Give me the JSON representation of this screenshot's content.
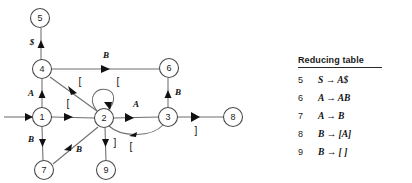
{
  "diagram": {
    "type": "state-transition-graph",
    "nodes": [
      {
        "id": "5",
        "label": "5",
        "cx": 40,
        "cy": 18
      },
      {
        "id": "4",
        "label": "4",
        "cx": 42,
        "cy": 69
      },
      {
        "id": "6",
        "label": "6",
        "cx": 169,
        "cy": 68
      },
      {
        "id": "1",
        "label": "1",
        "cx": 42,
        "cy": 117
      },
      {
        "id": "2",
        "label": "2",
        "cx": 104,
        "cy": 118
      },
      {
        "id": "3",
        "label": "3",
        "cx": 168,
        "cy": 117
      },
      {
        "id": "8",
        "label": "8",
        "cx": 233,
        "cy": 117
      },
      {
        "id": "7",
        "label": "7",
        "cx": 44,
        "cy": 170
      },
      {
        "id": "9",
        "label": "9",
        "cx": 106,
        "cy": 170
      }
    ],
    "edges": [
      {
        "from": "start",
        "to": "1",
        "label": ""
      },
      {
        "from": "4",
        "to": "5",
        "label": "$"
      },
      {
        "from": "1",
        "to": "4",
        "label": "A"
      },
      {
        "from": "4",
        "to": "6",
        "label": "B"
      },
      {
        "from": "4",
        "to": "2",
        "label": "["
      },
      {
        "from": "1",
        "to": "2",
        "label": "["
      },
      {
        "from": "2",
        "to": "2",
        "label": "["
      },
      {
        "from": "2",
        "to": "3",
        "label": "A"
      },
      {
        "from": "3",
        "to": "2",
        "label": "["
      },
      {
        "from": "3",
        "to": "6",
        "label": "B"
      },
      {
        "from": "3",
        "to": "8",
        "label": "]"
      },
      {
        "from": "1",
        "to": "7",
        "label": "B"
      },
      {
        "from": "7",
        "to": "2",
        "label": "B"
      },
      {
        "from": "2",
        "to": "9",
        "label": "]"
      }
    ]
  },
  "reducing_table": {
    "title": "Reducing table",
    "rows": [
      {
        "num": "5",
        "rule": "S → A$"
      },
      {
        "num": "6",
        "rule": "A → AB"
      },
      {
        "num": "7",
        "rule": "A → B"
      },
      {
        "num": "8",
        "rule": "B → [A]"
      },
      {
        "num": "9",
        "rule": "B → [ ]"
      }
    ]
  }
}
